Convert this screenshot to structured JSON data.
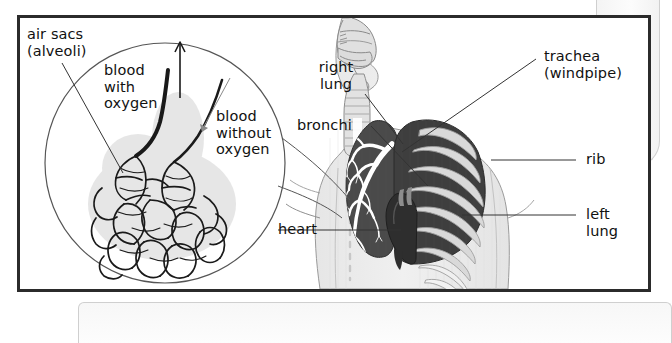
{
  "figure": {
    "frame_border_color": "#2b2b2b",
    "background_color": "#ffffff"
  },
  "labels": {
    "air_sacs": "air sacs\n(alveoli)",
    "blood_with_oxygen": "blood\nwith\noxygen",
    "blood_without_oxygen": "blood\nwithout\noxygen",
    "right_lung": "right\nlung",
    "bronchi": "bronchi",
    "trachea": "trachea\n(windpipe)",
    "rib": "rib",
    "left_lung": "left\nlung",
    "heart": "heart"
  },
  "colors": {
    "lung_fill": "#4a4a4a",
    "lung_fill_left": "#3f3f3f",
    "body_fill": "#ededed",
    "airway_fill": "#d8d8d8",
    "rib_fill": "#d9d9d9",
    "bronchi_fill": "#ffffff",
    "heart_fill": "#333333",
    "outline": "#555555",
    "leader_line": "#333333",
    "inset_circle_stroke": "#555555"
  },
  "inset": {
    "name": "alveoli-magnification-circle",
    "center_x": 145,
    "center_y": 145,
    "radius": 120
  }
}
